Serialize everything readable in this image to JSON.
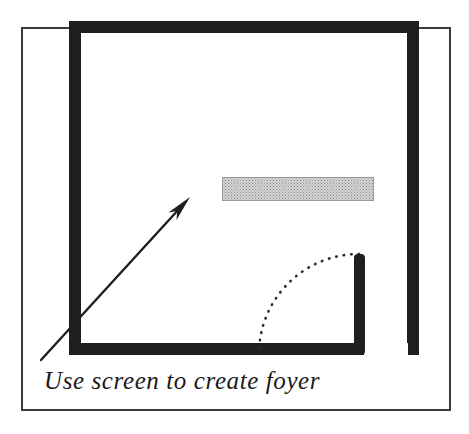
{
  "figure": {
    "name": "floor-plan-sketch",
    "background_color": "#ffffff",
    "ink_color": "#1a1a1a",
    "caption": "Use screen to create foyer"
  },
  "outer_border": {
    "name": "outer-frame",
    "stroke_color": "#3a3a3a",
    "stroke_width": 2,
    "x": 22,
    "y": 28,
    "width": 428,
    "height": 382
  },
  "room": {
    "name": "room-walls",
    "fill_color": "#1f1f1f",
    "wall_thickness": 12,
    "outer": {
      "x": 69,
      "y": 21,
      "width": 350,
      "height": 334
    },
    "door_opening": {
      "name": "door-opening",
      "label": "door opening in bottom wall",
      "x": 364,
      "width": 44
    }
  },
  "screen": {
    "name": "folding-screen",
    "label": "screen",
    "fill_color": "#c8c8c8",
    "stroke_color": "#9a9a9a",
    "pattern": "halftone-dither",
    "x": 222,
    "y": 177,
    "width": 152,
    "height": 24
  },
  "door": {
    "name": "door-leaf-and-swing",
    "post": {
      "name": "door-post",
      "x": 354,
      "y": 254,
      "width": 11,
      "height": 101,
      "fill_color": "#1f1f1f"
    },
    "swing_arc": {
      "name": "door-swing-arc",
      "style": "dotted",
      "stroke_color": "#2b2b2b",
      "center_x": 359,
      "center_y": 354,
      "radius": 100,
      "start_angle_deg": 270,
      "end_angle_deg": 180
    }
  },
  "annotation_arrow": {
    "name": "callout-arrow",
    "stroke_color": "#1f1f1f",
    "stroke_width": 2.4,
    "tail_x": 41,
    "tail_y": 360,
    "tip_x": 190,
    "tip_y": 197,
    "head_length": 26,
    "head_width": 11
  },
  "caption": {
    "name": "figure-caption",
    "text": "Use screen to create foyer",
    "x": 44,
    "y": 389,
    "font_size_px": 25,
    "style": "italic",
    "color": "#1a1a1a"
  }
}
